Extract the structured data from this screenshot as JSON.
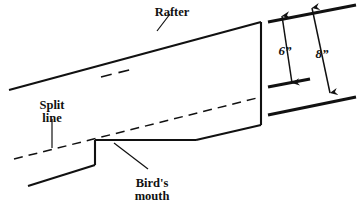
{
  "figure": {
    "background_color": "#ffffff",
    "line_color": "#111111",
    "width": 361,
    "height": 204
  },
  "labels": {
    "rafter": "Rafter",
    "split_line_1": "Split",
    "split_line_2": "line",
    "birds_mouth_1": "Bird's",
    "birds_mouth_2": "mouth"
  },
  "dimensions": {
    "depth_small": "6”",
    "depth_large": "8”"
  },
  "geometry": {
    "top_edge": "9,90 261,22",
    "bottom_edge": "28,186 95,165",
    "notch_vertical": "95,165 95,140",
    "seat_cut": "95,140 196,140",
    "plumb_cut_rise": "196,140 261,125",
    "right_vertical": "261,22 261,125",
    "split_line": "14,159 261,97",
    "rafter_centerline": "101,77 133,69",
    "seat_centerline": "124,140 168,140",
    "split_left_stub": "14,159 38,153",
    "leader_rafter": "157,31 170,14",
    "leader_split": "52,148 52,119",
    "leader_birds_mouth": "114,143 148,169",
    "dim_ref_top": "268,22 356,5",
    "dim_ref_mid": "268,87 310,79",
    "dim_ref_bottom": "268,115 356,97",
    "dim_arrow_6_x": "282,16 292,83",
    "dim_arrow_8_x": "312,8 330,93",
    "label_rafter_pos": "172,12",
    "label_split_pos": "52,105",
    "label_split_pos2": "52,118",
    "label_birds_pos": "152,184",
    "label_birds_pos2": "152,197",
    "label_6_pos": "285,50",
    "label_8_pos": "321,54"
  }
}
